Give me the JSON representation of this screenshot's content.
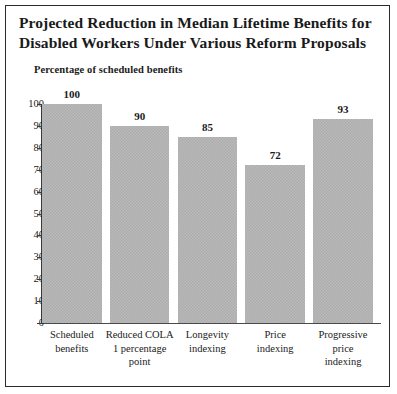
{
  "figure": {
    "title_lines": [
      "Projected Reduction in Median Lifetime Benefits for",
      "Disabled Workers Under Various Reform Proposals"
    ],
    "subtitle": "Percentage of scheduled benefits",
    "bar_color": "#b2b2b2",
    "axis_color": "#3a3a3a",
    "text_color": "#1a1a1a",
    "border_color": "#2b2b2b"
  },
  "chart_data": {
    "type": "bar",
    "subtitle": "Percentage of scheduled benefits",
    "xlabel": "",
    "ylabel": "Percentage of scheduled benefits",
    "ylim": [
      0,
      100
    ],
    "yticks": [
      0,
      10,
      20,
      30,
      40,
      50,
      60,
      70,
      80,
      90,
      100
    ],
    "ytick_labels": [
      "0",
      "10",
      "20",
      "30",
      "40",
      "50",
      "60",
      "70",
      "80",
      "90",
      "100"
    ],
    "grid": false,
    "legend": "none",
    "categories": [
      "Scheduled benefits",
      "Reduced COLA 1 percentage point",
      "Longevity indexing",
      "Price indexing",
      "Progressive price indexing"
    ],
    "category_label_lines": [
      [
        "Scheduled",
        "benefits"
      ],
      [
        "Reduced COLA",
        "1 percentage",
        "point"
      ],
      [
        "Longevity",
        "indexing"
      ],
      [
        "Price",
        "indexing"
      ],
      [
        "Progressive",
        "price",
        "indexing"
      ]
    ],
    "values": [
      100,
      90,
      85,
      72,
      93
    ],
    "value_labels": [
      "100",
      "90",
      "85",
      "72",
      "93"
    ]
  }
}
